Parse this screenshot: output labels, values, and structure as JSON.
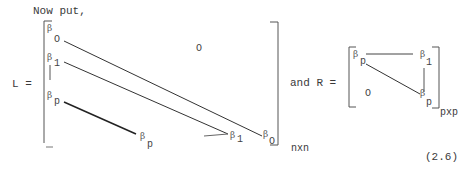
{
  "intro": "Now put,",
  "L_matrix": {
    "label": "L =",
    "size": "nxn",
    "zero_entry": "O",
    "diagonals": [
      {
        "start": {
          "sym": "β",
          "sub": "O"
        },
        "end": {
          "sym": "β",
          "sub": "O"
        }
      },
      {
        "start": {
          "sym": "β",
          "sub": "1"
        },
        "end": {
          "sym": "β",
          "sub": "1"
        }
      },
      {
        "start": {
          "sym": "β",
          "sub": "p"
        },
        "end": {
          "sym": "β",
          "sub": "p"
        }
      }
    ]
  },
  "connector": "and R =",
  "R_matrix": {
    "size": "pxp",
    "size_prefix": "p",
    "zero_entry": "O",
    "entries": [
      {
        "sym": "β",
        "sub": "p"
      },
      {
        "sym": "β",
        "sub": "1"
      },
      {
        "sym": "β",
        "sub": "p"
      }
    ]
  },
  "equation_number": "(2.6)"
}
